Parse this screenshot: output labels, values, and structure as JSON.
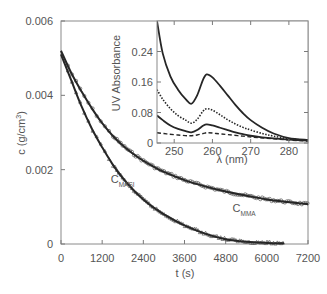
{
  "chart_data": [
    {
      "type": "line",
      "title": "",
      "xlabel": "t (s)",
      "ylabel": "c (g/cm³)",
      "xlim": [
        0,
        7200
      ],
      "ylim": [
        0,
        0.006
      ],
      "xticks": [
        0,
        1200,
        2400,
        3600,
        4800,
        6000,
        7200
      ],
      "xtick_labels": [
        "0",
        "1200",
        "2400",
        "3600",
        "4800",
        "6000",
        "7200"
      ],
      "yticks": [
        0,
        0.002,
        0.004,
        0.006
      ],
      "ytick_labels": [
        "0",
        "0.002",
        "0.004",
        "0.006"
      ],
      "grid": false,
      "series": [
        {
          "name": "C_MMA",
          "label_main": "C",
          "label_sub": "MMA",
          "style": "solid-with-circle-markers",
          "x": [
            0,
            300,
            600,
            900,
            1200,
            1500,
            1800,
            2100,
            2400,
            2700,
            3000,
            3600,
            4200,
            4800,
            5400,
            6000,
            6600,
            7200
          ],
          "y": [
            0.0052,
            0.0046,
            0.0041,
            0.00365,
            0.00325,
            0.00292,
            0.00265,
            0.00243,
            0.00224,
            0.00208,
            0.00194,
            0.00172,
            0.00155,
            0.00141,
            0.0013,
            0.0012,
            0.00113,
            0.00107
          ]
        },
        {
          "name": "C_MASI",
          "label_main": "C",
          "label_sub": "MASI",
          "style": "solid-with-triangle-markers",
          "x": [
            0,
            300,
            600,
            900,
            1200,
            1500,
            1800,
            2100,
            2400,
            2700,
            3000,
            3600,
            4200,
            4800,
            5400,
            6000,
            6500
          ],
          "y": [
            0.0051,
            0.0044,
            0.0037,
            0.0031,
            0.0026,
            0.00215,
            0.00177,
            0.00146,
            0.0012,
            0.00098,
            0.0008,
            0.0005,
            0.00028,
            0.00013,
            6e-05,
            3e-05,
            2e-05
          ]
        }
      ],
      "annotations": [
        {
          "text": "C",
          "sub": "MASI",
          "x": 1450,
          "y": 0.00165
        },
        {
          "text": "C",
          "sub": "MMA",
          "x": 5000,
          "y": 0.00085
        }
      ]
    },
    {
      "type": "line",
      "title": "",
      "position": "inset-top-right",
      "xlabel": "λ (nm)",
      "ylabel": "UV Absorbance",
      "xlim": [
        245.5,
        285
      ],
      "ylim": [
        0,
        0.32
      ],
      "xticks": [
        250,
        260,
        270,
        280
      ],
      "xtick_labels": [
        "250",
        "260",
        "270",
        "280"
      ],
      "yticks": [
        0,
        0.08,
        0.16,
        0.24
      ],
      "ytick_labels": [
        "0",
        "0.08",
        "0.16",
        "0.24"
      ],
      "grid": false,
      "series": [
        {
          "name": "spectrum-1",
          "style": "solid",
          "x": [
            245.5,
            247,
            249,
            251,
            253,
            254.5,
            256,
            257.5,
            258.5,
            260,
            262,
            264,
            266,
            268,
            270,
            273,
            276,
            280,
            285
          ],
          "y": [
            0.32,
            0.235,
            0.175,
            0.14,
            0.115,
            0.103,
            0.125,
            0.165,
            0.18,
            0.172,
            0.15,
            0.125,
            0.1,
            0.078,
            0.06,
            0.04,
            0.025,
            0.013,
            0.008
          ]
        },
        {
          "name": "spectrum-2",
          "style": "dotted",
          "x": [
            245.5,
            247,
            249,
            251,
            253,
            254.5,
            256,
            257.5,
            258.5,
            260,
            262,
            264,
            266,
            268,
            270,
            273,
            276,
            280,
            285
          ],
          "y": [
            0.14,
            0.115,
            0.09,
            0.072,
            0.06,
            0.052,
            0.062,
            0.083,
            0.09,
            0.086,
            0.074,
            0.061,
            0.05,
            0.041,
            0.034,
            0.025,
            0.018,
            0.011,
            0.007
          ]
        },
        {
          "name": "spectrum-3",
          "style": "solid",
          "x": [
            245.5,
            247,
            249,
            251,
            253,
            254.5,
            256,
            257.5,
            258.5,
            260,
            262,
            264,
            266,
            268,
            270,
            273,
            276,
            280,
            285
          ],
          "y": [
            0.072,
            0.06,
            0.046,
            0.037,
            0.031,
            0.028,
            0.034,
            0.045,
            0.049,
            0.046,
            0.04,
            0.034,
            0.028,
            0.023,
            0.019,
            0.015,
            0.012,
            0.009,
            0.006
          ]
        },
        {
          "name": "spectrum-4",
          "style": "dashed",
          "x": [
            245.5,
            248,
            251,
            254,
            256,
            258,
            259,
            261,
            264,
            268,
            272,
            276,
            280,
            285
          ],
          "y": [
            0.027,
            0.024,
            0.021,
            0.019,
            0.021,
            0.026,
            0.027,
            0.025,
            0.022,
            0.018,
            0.014,
            0.011,
            0.008,
            0.005
          ]
        }
      ]
    }
  ],
  "colors": {
    "axis": "#7a7a7a",
    "curve": "#262626",
    "marker": "#5a5a5a",
    "text": "#555555"
  }
}
